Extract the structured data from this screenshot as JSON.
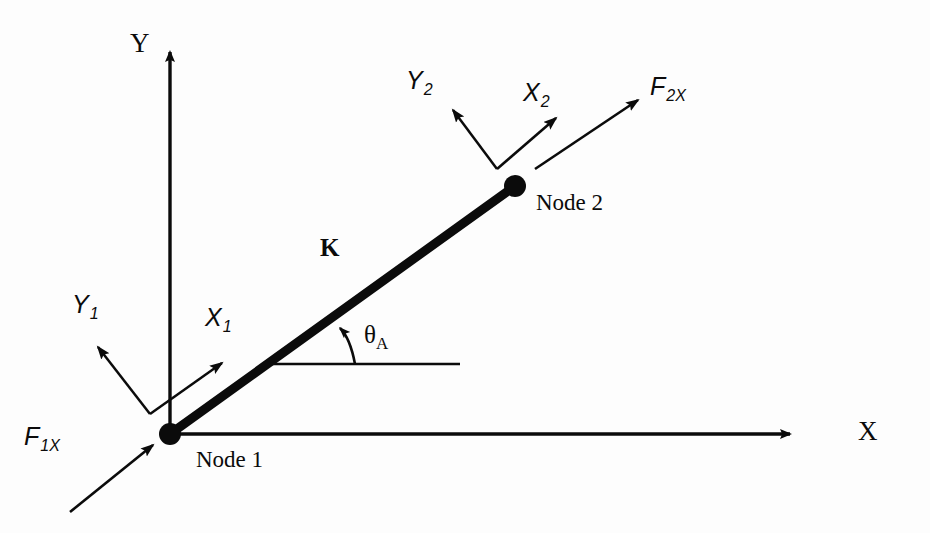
{
  "figure": {
    "domain": "diagram",
    "kind": "structural-truss-element",
    "background_color": "#fdfdfd",
    "ink_color": "#0b0b0b"
  },
  "global_axes": {
    "y_axis": {
      "label": "Y",
      "label_x": 130,
      "label_y": 30,
      "origin_x": 170,
      "origin_y": 434,
      "tip_x": 170,
      "tip_y": 40
    },
    "x_axis": {
      "label": "X",
      "label_x": 858,
      "label_y": 418,
      "origin_x": 170,
      "origin_y": 434,
      "tip_x": 800,
      "tip_y": 434
    }
  },
  "element": {
    "stiffness_label": "K",
    "stiffness_label_x": 320,
    "stiffness_label_y": 235,
    "start_x": 170,
    "start_y": 434,
    "end_x": 515,
    "end_y": 186,
    "line_width": 9
  },
  "nodes": [
    {
      "id": "node-1",
      "label": "Node 1",
      "x": 170,
      "y": 434,
      "radius": 11,
      "label_x": 196,
      "label_y": 448
    },
    {
      "id": "node-2",
      "label": "Node 2",
      "x": 515,
      "y": 186,
      "radius": 11,
      "label_x": 536,
      "label_y": 191
    }
  ],
  "local_axes": [
    {
      "id": "node-1-local",
      "origin_x": 150,
      "origin_y": 414,
      "x_axis": {
        "label": "X",
        "subscript": "1",
        "tip_x": 228,
        "tip_y": 358,
        "label_x": 205,
        "label_y": 305
      },
      "y_axis": {
        "label": "Y",
        "subscript": "1",
        "tip_x": 92,
        "tip_y": 340,
        "label_x": 72,
        "label_y": 292
      }
    },
    {
      "id": "node-2-local",
      "origin_x": 497,
      "origin_y": 169,
      "x_axis": {
        "label": "X",
        "subscript": "2",
        "tip_x": 562,
        "tip_y": 112,
        "label_x": 523,
        "label_y": 80
      },
      "y_axis": {
        "label": "Y",
        "subscript": "2",
        "tip_x": 447,
        "tip_y": 103,
        "label_x": 406,
        "label_y": 68
      }
    }
  ],
  "forces": [
    {
      "id": "force-node-1",
      "label": "F",
      "subscript": "1X",
      "tail_x": 70,
      "tail_y": 512,
      "tip_x": 160,
      "tip_y": 440,
      "label_x": 24,
      "label_y": 424
    },
    {
      "id": "force-node-2",
      "label": "F",
      "subscript": "2X",
      "tail_x": 535,
      "tail_y": 169,
      "tip_x": 645,
      "tip_y": 95,
      "label_x": 650,
      "label_y": 74
    }
  ],
  "angle": {
    "label": "θ",
    "subscript": "A",
    "label_x": 364,
    "label_y": 322,
    "reference_line": {
      "start_x": 270,
      "start_y": 364,
      "end_x": 460,
      "end_y": 364
    },
    "arc_tail_x": 355,
    "arc_tail_y": 364,
    "arc_tip_x": 337,
    "arc_tip_y": 322
  }
}
